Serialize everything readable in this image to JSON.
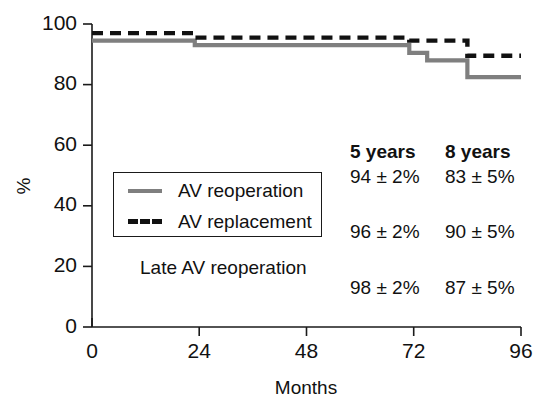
{
  "chart_data": {
    "type": "line",
    "title": "",
    "subtitle": "",
    "xlabel": "Months",
    "ylabel": "%",
    "xlim": [
      0,
      96
    ],
    "ylim": [
      0,
      100
    ],
    "xticks": [
      0,
      24,
      48,
      72,
      96
    ],
    "yticks": [
      0,
      20,
      40,
      60,
      80,
      100
    ],
    "xtick_labels": [
      "0",
      "24",
      "48",
      "72",
      "96"
    ],
    "ytick_labels": [
      "0",
      "20",
      "40",
      "60",
      "80",
      "100"
    ],
    "grid": false,
    "legend_position": "inside-left",
    "step_style": "post",
    "series": [
      {
        "name": "AV reoperation",
        "style": "solid",
        "color": "#7f7f7f",
        "x": [
          0,
          23,
          23,
          71,
          71,
          75,
          75,
          84,
          84,
          96
        ],
        "y": [
          94.5,
          94.5,
          93.0,
          93.0,
          90.5,
          90.5,
          88.0,
          88.0,
          82.5,
          82.5
        ]
      },
      {
        "name": "AV replacement",
        "style": "dashed",
        "color": "#111111",
        "x": [
          0,
          23,
          23,
          71,
          71,
          84,
          84,
          96
        ],
        "y": [
          97.0,
          97.0,
          95.5,
          95.5,
          94.5,
          94.5,
          89.5,
          89.5
        ]
      }
    ],
    "annotations": []
  },
  "legend": {
    "items": [
      {
        "label": "AV reoperation",
        "swatch": "solid-gray-line"
      },
      {
        "label": "AV replacement",
        "swatch": "dashed-black-line"
      }
    ]
  },
  "note": {
    "label": "Late AV reoperation"
  },
  "stats_table": {
    "headers": [
      "5 years",
      "8 years"
    ],
    "rows": [
      {
        "values": [
          "94 ± 2%",
          "83 ± 5%"
        ]
      },
      {
        "values": [
          "96 ± 2%",
          "90 ± 5%"
        ]
      },
      {
        "values": [
          "98 ± 2%",
          "87 ± 5%"
        ]
      }
    ]
  }
}
